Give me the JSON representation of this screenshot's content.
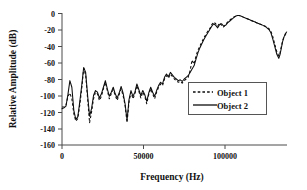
{
  "chart_data": {
    "type": "line",
    "title": "",
    "xlabel": "Frequency (Hz)",
    "ylabel": "Relative Amplitude (dB)",
    "xlim": [
      0,
      137000
    ],
    "ylim": [
      -160,
      0
    ],
    "xticks": [
      0,
      50000,
      100000
    ],
    "xtick_labels": [
      "0",
      "50000",
      "100000"
    ],
    "yticks": [
      0,
      -20,
      -40,
      -60,
      -80,
      -100,
      -120,
      -140,
      -160
    ],
    "ytick_labels": [
      "0",
      "-20",
      "-40",
      "-60",
      "-80",
      "-100",
      "-120",
      "-140",
      "-160"
    ],
    "grid": false,
    "legend_position": "center-right",
    "legend_entries": [
      {
        "label": "Object 1",
        "style": "dashed"
      },
      {
        "label": "Object 2",
        "style": "solid"
      }
    ],
    "series": [
      {
        "name": "Object 1",
        "style": "dashed",
        "x": [
          0,
          1200,
          2400,
          3600,
          4800,
          6000,
          7200,
          8400,
          9600,
          10800,
          12000,
          13200,
          14400,
          15600,
          16800,
          18000,
          19200,
          20400,
          21600,
          22800,
          24000,
          25200,
          26400,
          27600,
          28800,
          30000,
          31200,
          32400,
          33600,
          34800,
          36000,
          37200,
          38400,
          39600,
          40800,
          42000,
          43200,
          44400,
          45600,
          46800,
          48000,
          49200,
          50400,
          51600,
          52800,
          54000,
          55200,
          56400,
          57600,
          58800,
          60000,
          61200,
          62400,
          63600,
          64800,
          66000,
          67200,
          68400,
          69600,
          70800,
          72000,
          73200,
          74400,
          75600,
          76800,
          78000,
          79200,
          80400,
          81600,
          82800,
          84000,
          85200,
          86400,
          87600,
          88800,
          90000,
          91200,
          92400,
          93600,
          94800,
          96000,
          97200,
          98400,
          99600,
          100800,
          102000,
          103200,
          104400,
          105600,
          106800,
          108000,
          109200,
          110400,
          111600,
          112800,
          114000,
          115200,
          116400,
          117600,
          118800,
          120000,
          121200,
          122400,
          123600,
          124800,
          126000,
          127200,
          128400,
          129600,
          130800,
          132000,
          132800,
          133600,
          134400,
          135200,
          136000,
          136800
        ],
        "y": [
          -114,
          -114,
          -112,
          -101,
          -97,
          -104,
          -122,
          -131,
          -128,
          -112,
          -92,
          -67,
          -75,
          -104,
          -133,
          -120,
          -104,
          -96,
          -98,
          -106,
          -101,
          -92,
          -84,
          -94,
          -104,
          -98,
          -93,
          -100,
          -106,
          -99,
          -92,
          -100,
          -112,
          -133,
          -108,
          -96,
          -104,
          -98,
          -88,
          -95,
          -103,
          -96,
          -101,
          -110,
          -99,
          -92,
          -98,
          -104,
          -96,
          -90,
          -86,
          -88,
          -80,
          -76,
          -79,
          -74,
          -77,
          -80,
          -82,
          -84,
          -83,
          -85,
          -82,
          -80,
          -78,
          -70,
          -57,
          -62,
          -52,
          -45,
          -40,
          -35,
          -30,
          -26,
          -22,
          -19,
          -14,
          -11,
          -13,
          -16,
          -12,
          -15,
          -17,
          -14,
          -11,
          -9,
          -7,
          -5,
          -4,
          -3,
          -3,
          -4,
          -5,
          -6,
          -7,
          -8,
          -9,
          -10,
          -11,
          -12,
          -13,
          -14,
          -15,
          -16,
          -17,
          -19,
          -22,
          -29,
          -38,
          -47,
          -52,
          -48,
          -40,
          -33,
          -29,
          -26,
          -24
        ]
      },
      {
        "name": "Object 2",
        "style": "solid",
        "x": [
          0,
          1200,
          2400,
          3600,
          4800,
          6000,
          7200,
          8400,
          9600,
          10800,
          12000,
          13200,
          14400,
          15600,
          16800,
          18000,
          19200,
          20400,
          21600,
          22800,
          24000,
          25200,
          26400,
          27600,
          28800,
          30000,
          31200,
          32400,
          33600,
          34800,
          36000,
          37200,
          38400,
          39600,
          40800,
          42000,
          43200,
          44400,
          45600,
          46800,
          48000,
          49200,
          50400,
          51600,
          52800,
          54000,
          55200,
          56400,
          57600,
          58800,
          60000,
          61200,
          62400,
          63600,
          64800,
          66000,
          67200,
          68400,
          69600,
          70800,
          72000,
          73200,
          74400,
          75600,
          76800,
          78000,
          79200,
          80400,
          81600,
          82800,
          84000,
          85200,
          86400,
          87600,
          88800,
          90000,
          91200,
          92400,
          93600,
          94800,
          96000,
          97200,
          98400,
          99600,
          100800,
          102000,
          103200,
          104400,
          105600,
          106800,
          108000,
          109200,
          110400,
          111600,
          112800,
          114000,
          115200,
          116400,
          117600,
          118800,
          120000,
          121200,
          122400,
          123600,
          124800,
          126000,
          127200,
          128400,
          129600,
          130800,
          132000,
          132800,
          133600,
          134400,
          135200,
          136000,
          136800
        ],
        "y": [
          -116,
          -115,
          -113,
          -99,
          -82,
          -90,
          -118,
          -129,
          -126,
          -108,
          -88,
          -66,
          -72,
          -100,
          -125,
          -116,
          -100,
          -94,
          -96,
          -103,
          -98,
          -90,
          -82,
          -92,
          -101,
          -96,
          -90,
          -98,
          -103,
          -97,
          -89,
          -97,
          -110,
          -130,
          -105,
          -94,
          -101,
          -96,
          -86,
          -93,
          -100,
          -94,
          -99,
          -107,
          -97,
          -90,
          -96,
          -101,
          -94,
          -88,
          -84,
          -86,
          -78,
          -74,
          -77,
          -72,
          -75,
          -78,
          -80,
          -82,
          -81,
          -83,
          -80,
          -78,
          -76,
          -72,
          -68,
          -64,
          -56,
          -48,
          -42,
          -37,
          -32,
          -28,
          -24,
          -20,
          -16,
          -13,
          -15,
          -18,
          -14,
          -13,
          -16,
          -15,
          -12,
          -10,
          -8,
          -6,
          -4,
          -3,
          -3,
          -4,
          -5,
          -6,
          -7,
          -8,
          -9,
          -10,
          -11,
          -12,
          -13,
          -14,
          -15,
          -16,
          -18,
          -20,
          -24,
          -32,
          -41,
          -50,
          -55,
          -50,
          -42,
          -34,
          -29,
          -25,
          -23
        ]
      }
    ]
  }
}
